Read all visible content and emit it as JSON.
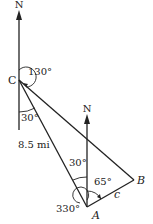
{
  "diagram": {
    "points": {
      "C": {
        "label": "C",
        "x": 19,
        "y": 80
      },
      "A": {
        "label": "A",
        "x": 87,
        "y": 207
      },
      "B": {
        "label": "B",
        "x": 134,
        "y": 180
      }
    },
    "north_labels": {
      "at_C": "N",
      "at_A": "N"
    },
    "angles": {
      "C_bearing": "130°",
      "C_to_A_angle": "30°",
      "A_to_C_angle": "30°",
      "A_to_B_angle": "65°",
      "A_bearing": "330°"
    },
    "sides": {
      "CA": "8.5 mi",
      "AB": "c"
    },
    "colors": {
      "line": "#222222",
      "background": "#ffffff"
    }
  }
}
